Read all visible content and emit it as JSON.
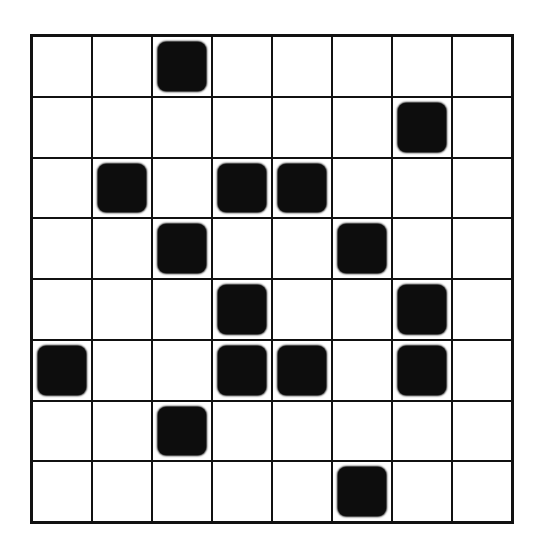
{
  "grid": {
    "rows": 8,
    "cols": 8,
    "fill_color": "#0d0d0d",
    "line_color": "#111111",
    "cells": [
      [
        0,
        0,
        1,
        0,
        0,
        0,
        0,
        0
      ],
      [
        0,
        0,
        0,
        0,
        0,
        0,
        1,
        0
      ],
      [
        0,
        1,
        0,
        1,
        1,
        0,
        0,
        0
      ],
      [
        0,
        0,
        1,
        0,
        0,
        1,
        0,
        0
      ],
      [
        0,
        0,
        0,
        1,
        0,
        0,
        1,
        0
      ],
      [
        1,
        0,
        0,
        1,
        1,
        0,
        1,
        0
      ],
      [
        0,
        0,
        1,
        0,
        0,
        0,
        0,
        0
      ],
      [
        0,
        0,
        0,
        0,
        0,
        1,
        0,
        0
      ]
    ]
  }
}
